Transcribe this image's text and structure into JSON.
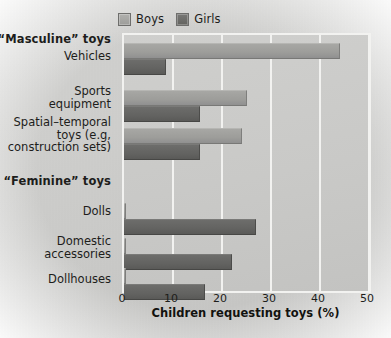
{
  "chart_data": {
    "type": "bar",
    "orientation": "horizontal",
    "title": "",
    "xlabel": "Children requesting toys (%)",
    "ylabel": "",
    "xlim": [
      0,
      50
    ],
    "xticks": [
      0,
      10,
      20,
      30,
      40,
      50
    ],
    "grid": true,
    "legend_position": "top-left",
    "categories": [
      "Vehicles",
      "Sports equipment",
      "Spatial–temporal toys (e.g, construction sets)",
      "Dolls",
      "Domestic accessories",
      "Dollhouses"
    ],
    "series": [
      {
        "name": "Boys",
        "color": "#9d9d9a",
        "values": [
          44,
          25,
          24,
          0.4,
          0.4,
          0.4
        ]
      },
      {
        "name": "Girls",
        "color": "#63635f",
        "values": [
          8.5,
          15.5,
          15.5,
          27,
          22,
          16.5
        ]
      }
    ],
    "section_headers": [
      {
        "label": "“Masculine” toys",
        "applies_to": [
          "Vehicles",
          "Sports equipment",
          "Spatial–temporal toys (e.g, construction sets)"
        ]
      },
      {
        "label": "“Feminine” toys",
        "applies_to": [
          "Dolls",
          "Domestic accessories",
          "Dollhouses"
        ]
      }
    ]
  },
  "legend": {
    "entries": [
      {
        "label": "Boys",
        "swatch_color": "#9d9d9a"
      },
      {
        "label": "Girls",
        "swatch_color": "#63635f"
      }
    ]
  },
  "axis": {
    "x_title": "Children requesting toys (%)",
    "x_tick_labels": [
      "0",
      "10",
      "20",
      "30",
      "40",
      "50"
    ]
  },
  "y_axis_rows": [
    {
      "id": "masc-header",
      "text": "“Masculine” toys",
      "bold": true
    },
    {
      "id": "vehicles",
      "text": "Vehicles",
      "bold": false
    },
    {
      "id": "sports",
      "text": "Sports\nequipment",
      "bold": false
    },
    {
      "id": "spatial",
      "text": "Spatial–temporal\ntoys (e.g,\nconstruction sets)",
      "bold": false
    },
    {
      "id": "fem-header",
      "text": "“Feminine” toys",
      "bold": true
    },
    {
      "id": "dolls",
      "text": "Dolls",
      "bold": false
    },
    {
      "id": "domestic",
      "text": "Domestic\naccessories",
      "bold": false
    },
    {
      "id": "dollhouses",
      "text": "Dollhouses",
      "bold": false
    }
  ],
  "colors": {
    "boys_bar": "#9d9d9a",
    "girls_bar": "#63635f",
    "plot_background": "#c9c9c7",
    "gridline": "#f2f2f0",
    "text": "#1d1d1b"
  }
}
